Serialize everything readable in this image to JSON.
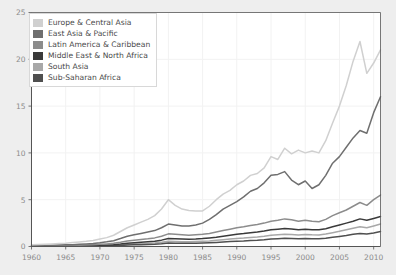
{
  "chart_data": {
    "type": "line",
    "title": "",
    "subtitle": "",
    "xlabel": "",
    "ylabel": "",
    "xlim": [
      1960,
      2011
    ],
    "ylim": [
      0,
      25
    ],
    "xticks": [
      1960,
      1965,
      1970,
      1975,
      1980,
      1985,
      1990,
      1995,
      2000,
      2005,
      2010
    ],
    "yticks": [
      0,
      5,
      10,
      15,
      20,
      25
    ],
    "grid": true,
    "legend_position": "upper-left",
    "x": [
      1960,
      1961,
      1962,
      1963,
      1964,
      1965,
      1966,
      1967,
      1968,
      1969,
      1970,
      1971,
      1972,
      1973,
      1974,
      1975,
      1976,
      1977,
      1978,
      1979,
      1980,
      1981,
      1982,
      1983,
      1984,
      1985,
      1986,
      1987,
      1988,
      1989,
      1990,
      1991,
      1992,
      1993,
      1994,
      1995,
      1996,
      1997,
      1998,
      1999,
      2000,
      2001,
      2002,
      2003,
      2004,
      2005,
      2006,
      2007,
      2008,
      2009,
      2010,
      2011
    ],
    "series": [
      {
        "name": "Europe & Central Asia",
        "color": "#d0d0d0",
        "values": [
          0.2,
          0.22,
          0.25,
          0.28,
          0.32,
          0.36,
          0.42,
          0.48,
          0.55,
          0.65,
          0.8,
          0.95,
          1.2,
          1.6,
          2.0,
          2.3,
          2.6,
          2.9,
          3.3,
          4.0,
          5.0,
          4.4,
          4.0,
          3.85,
          3.8,
          3.8,
          4.3,
          5.0,
          5.6,
          6.0,
          6.6,
          7.0,
          7.6,
          7.8,
          8.4,
          9.6,
          9.3,
          10.5,
          9.9,
          10.3,
          10.0,
          10.2,
          10.0,
          11.3,
          13.2,
          15.0,
          17.2,
          19.8,
          21.9,
          18.5,
          19.6,
          21.0
        ]
      },
      {
        "name": "East Asia & Pacific",
        "color": "#6f6f6f",
        "values": [
          0.1,
          0.11,
          0.12,
          0.14,
          0.16,
          0.18,
          0.2,
          0.23,
          0.27,
          0.32,
          0.4,
          0.5,
          0.62,
          0.85,
          1.1,
          1.25,
          1.4,
          1.55,
          1.7,
          2.0,
          2.4,
          2.3,
          2.2,
          2.2,
          2.3,
          2.5,
          2.9,
          3.4,
          4.0,
          4.4,
          4.8,
          5.3,
          5.9,
          6.2,
          6.8,
          7.6,
          7.7,
          8.0,
          7.1,
          6.6,
          7.0,
          6.2,
          6.6,
          7.6,
          8.9,
          9.6,
          10.6,
          11.6,
          12.4,
          12.1,
          14.3,
          16.0
        ]
      },
      {
        "name": "Latin America & Caribbean",
        "color": "#8c8c8c",
        "values": [
          0.05,
          0.06,
          0.07,
          0.08,
          0.09,
          0.1,
          0.12,
          0.14,
          0.16,
          0.19,
          0.23,
          0.28,
          0.34,
          0.45,
          0.58,
          0.66,
          0.74,
          0.82,
          0.92,
          1.1,
          1.35,
          1.3,
          1.25,
          1.2,
          1.25,
          1.3,
          1.4,
          1.55,
          1.7,
          1.85,
          2.0,
          2.1,
          2.25,
          2.35,
          2.5,
          2.7,
          2.8,
          2.95,
          2.85,
          2.7,
          2.8,
          2.7,
          2.65,
          2.9,
          3.3,
          3.6,
          3.9,
          4.3,
          4.7,
          4.4,
          5.0,
          5.5
        ]
      },
      {
        "name": "Middle East & North Africa",
        "color": "#3a3a3a",
        "values": [
          0.03,
          0.035,
          0.04,
          0.045,
          0.05,
          0.06,
          0.07,
          0.08,
          0.09,
          0.11,
          0.13,
          0.16,
          0.2,
          0.26,
          0.34,
          0.4,
          0.45,
          0.5,
          0.56,
          0.68,
          0.85,
          0.82,
          0.8,
          0.78,
          0.8,
          0.85,
          0.92,
          1.0,
          1.1,
          1.2,
          1.3,
          1.38,
          1.48,
          1.55,
          1.65,
          1.78,
          1.85,
          1.92,
          1.88,
          1.8,
          1.85,
          1.8,
          1.78,
          1.9,
          2.1,
          2.3,
          2.5,
          2.7,
          2.95,
          2.8,
          3.0,
          3.2
        ]
      },
      {
        "name": "South Asia",
        "color": "#a8a8a8",
        "values": [
          0.02,
          0.022,
          0.025,
          0.028,
          0.032,
          0.036,
          0.042,
          0.05,
          0.058,
          0.07,
          0.085,
          0.1,
          0.13,
          0.17,
          0.22,
          0.26,
          0.3,
          0.33,
          0.37,
          0.45,
          0.56,
          0.54,
          0.52,
          0.51,
          0.53,
          0.56,
          0.6,
          0.66,
          0.72,
          0.79,
          0.86,
          0.9,
          0.97,
          1.02,
          1.1,
          1.2,
          1.25,
          1.3,
          1.28,
          1.24,
          1.28,
          1.25,
          1.24,
          1.33,
          1.48,
          1.62,
          1.78,
          1.95,
          2.1,
          2.0,
          2.2,
          2.4
        ]
      },
      {
        "name": "Sub-Saharan Africa",
        "color": "#4f4f4f",
        "values": [
          0.015,
          0.016,
          0.018,
          0.02,
          0.023,
          0.026,
          0.03,
          0.035,
          0.04,
          0.048,
          0.058,
          0.07,
          0.09,
          0.12,
          0.15,
          0.18,
          0.2,
          0.22,
          0.25,
          0.3,
          0.38,
          0.36,
          0.35,
          0.34,
          0.35,
          0.37,
          0.4,
          0.44,
          0.48,
          0.53,
          0.57,
          0.6,
          0.65,
          0.68,
          0.73,
          0.8,
          0.83,
          0.87,
          0.85,
          0.82,
          0.85,
          0.83,
          0.82,
          0.88,
          0.98,
          1.08,
          1.18,
          1.3,
          1.4,
          1.33,
          1.45,
          1.6
        ]
      }
    ]
  },
  "axes": {
    "x_tick_labels": [
      "1960",
      "1965",
      "1970",
      "1975",
      "1980",
      "1985",
      "1990",
      "1995",
      "2000",
      "2005",
      "2010"
    ],
    "y_tick_labels": [
      "0",
      "5",
      "10",
      "15",
      "20",
      "25"
    ]
  },
  "legend": {
    "items": [
      {
        "label": "Europe & Central Asia",
        "color": "#d0d0d0"
      },
      {
        "label": "East Asia & Pacific",
        "color": "#6f6f6f"
      },
      {
        "label": "Latin America & Caribbean",
        "color": "#8c8c8c"
      },
      {
        "label": "Middle East & North Africa",
        "color": "#3a3a3a"
      },
      {
        "label": "South Asia",
        "color": "#a8a8a8"
      },
      {
        "label": "Sub-Saharan Africa",
        "color": "#4f4f4f"
      }
    ]
  },
  "style": {
    "figure_background": "#eeeeee",
    "plot_background": "#ffffff",
    "grid_color": "#f2f2f2",
    "axis_color": "#555555",
    "tick_label_color": "#8a8a8a"
  }
}
